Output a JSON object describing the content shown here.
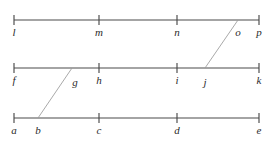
{
  "figure": {
    "width": 271,
    "height": 147,
    "background_color": "#ffffff",
    "line_color": "#4a4a4a",
    "transversal_color": "#9a9a9a",
    "label_color": "#2b2b2b",
    "caption": "",
    "lines": [
      {
        "name": "top-line",
        "y": 20,
        "x_start": 14,
        "x_end": 259,
        "points": [
          {
            "label": "l",
            "x": 14,
            "tick": true,
            "label_x": 14,
            "label_y": 27
          },
          {
            "label": "m",
            "x": 99,
            "tick": true,
            "label_x": 99,
            "label_y": 27
          },
          {
            "label": "n",
            "x": 177,
            "tick": true,
            "label_x": 177,
            "label_y": 27
          },
          {
            "label": "o",
            "x": 238,
            "tick": false,
            "label_x": 238,
            "label_y": 27
          },
          {
            "label": "p",
            "x": 259,
            "tick": true,
            "label_x": 259,
            "label_y": 27
          }
        ]
      },
      {
        "name": "middle-line",
        "y": 68,
        "x_start": 14,
        "x_end": 259,
        "points": [
          {
            "label": "f",
            "x": 14,
            "tick": true,
            "label_x": 14,
            "label_y": 75
          },
          {
            "label": "g",
            "x": 75,
            "tick": false,
            "label_x": 75,
            "label_y": 77
          },
          {
            "label": "h",
            "x": 99,
            "tick": true,
            "label_x": 99,
            "label_y": 75
          },
          {
            "label": "i",
            "x": 177,
            "tick": true,
            "label_x": 177,
            "label_y": 75
          },
          {
            "label": "j",
            "x": 205,
            "tick": false,
            "label_x": 205,
            "label_y": 77
          },
          {
            "label": "k",
            "x": 259,
            "tick": true,
            "label_x": 259,
            "label_y": 75
          }
        ]
      },
      {
        "name": "bottom-line",
        "y": 118,
        "x_start": 14,
        "x_end": 259,
        "points": [
          {
            "label": "a",
            "x": 14,
            "tick": true,
            "label_x": 14,
            "label_y": 125
          },
          {
            "label": "b",
            "x": 38,
            "tick": false,
            "label_x": 38,
            "label_y": 125
          },
          {
            "label": "c",
            "x": 99,
            "tick": true,
            "label_x": 99,
            "label_y": 125
          },
          {
            "label": "d",
            "x": 177,
            "tick": true,
            "label_x": 177,
            "label_y": 125
          },
          {
            "label": "e",
            "x": 259,
            "tick": true,
            "label_x": 259,
            "label_y": 125
          }
        ]
      }
    ],
    "transversals": [
      {
        "name": "transversal-b-g",
        "x1": 38,
        "y1": 118,
        "x2": 72,
        "y2": 68,
        "from": "b",
        "to": "g"
      },
      {
        "name": "transversal-j-o",
        "x1": 205,
        "y1": 68,
        "x2": 238,
        "y2": 20,
        "from": "j",
        "to": "o"
      }
    ],
    "tick_half_height": 5
  }
}
